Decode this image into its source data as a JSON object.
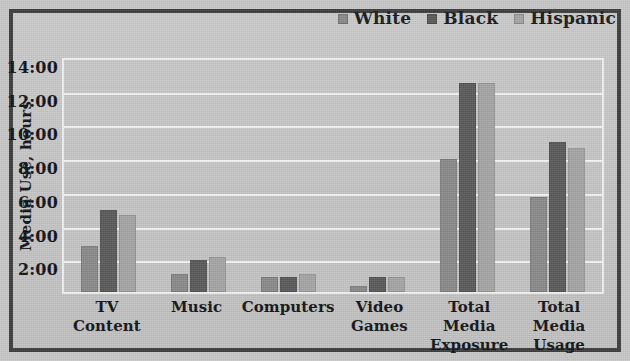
{
  "figure": {
    "frame_color": "#3c3c3c",
    "background_color": "#c8c8c8",
    "plot_background_color": "#c6c6c6",
    "gridline_color": "#f4f4f4"
  },
  "legend": {
    "position": "top-right",
    "items": [
      {
        "label": "White",
        "color": "#8a8a8a"
      },
      {
        "label": "Black",
        "color": "#5a5a5a"
      },
      {
        "label": "Hispanic",
        "color": "#a6a6a6"
      }
    ]
  },
  "axes": {
    "y_title": "Media Use, hours",
    "y_tick_labels": [
      "14:00",
      "12:00",
      "10:00",
      "8:00",
      "6:00",
      "4:00",
      "2:00"
    ],
    "y_tick_values": [
      14,
      12,
      10,
      8,
      6,
      4,
      2
    ],
    "y_min": 0,
    "y_max": 14
  },
  "chart_data": {
    "type": "bar",
    "title": "",
    "xlabel": "",
    "ylabel": "Media Use, hours",
    "ylim": [
      0,
      14
    ],
    "ytick_labels": [
      "2:00",
      "4:00",
      "6:00",
      "8:00",
      "10:00",
      "12:00",
      "14:00"
    ],
    "yticks": [
      2,
      4,
      6,
      8,
      10,
      12,
      14
    ],
    "grid": true,
    "legend_position": "top-right",
    "value_format": "h:mm",
    "categories": [
      "TV Content",
      "Music",
      "Computers",
      "Video Games",
      "Total Media Exposure",
      "Total Media Usage"
    ],
    "category_lines": [
      [
        "TV Content",
        ""
      ],
      [
        "Music",
        ""
      ],
      [
        "Computers",
        ""
      ],
      [
        "Video",
        "Games"
      ],
      [
        "Total Media",
        "Exposure"
      ],
      [
        "Total",
        "Media Usage"
      ]
    ],
    "series": [
      {
        "name": "White",
        "color": "#8a8a8a",
        "values": [
          2.83,
          1.17,
          1.0,
          0.5,
          8.0,
          5.75
        ],
        "value_labels": [
          "2:50",
          "1:10",
          "1:00",
          "0:30",
          "8:00",
          "5:45"
        ]
      },
      {
        "name": "Black",
        "color": "#5a5a5a",
        "values": [
          5.0,
          2.0,
          1.0,
          1.0,
          12.5,
          9.0
        ],
        "value_labels": [
          "5:00",
          "2:00",
          "1:00",
          "1:00",
          "12:30",
          "9:00"
        ]
      },
      {
        "name": "Hispanic",
        "color": "#a6a6a6",
        "values": [
          4.67,
          2.17,
          1.17,
          1.0,
          12.5,
          8.67
        ],
        "value_labels": [
          "4:40",
          "2:10",
          "1:10",
          "1:00",
          "12:30",
          "8:40"
        ]
      }
    ]
  }
}
